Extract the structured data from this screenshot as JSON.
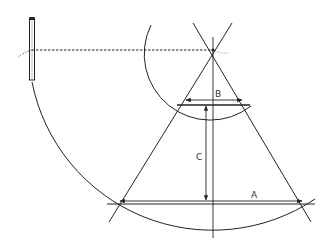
{
  "diagram": {
    "labels": {
      "A": "A",
      "B": "B",
      "C": "C"
    },
    "colors": {
      "stroke": "#222222",
      "background": "#ffffff"
    },
    "elements": [
      {
        "name": "pencil",
        "type": "tool"
      },
      {
        "name": "string-line",
        "type": "dashed-line"
      },
      {
        "name": "large-arc",
        "type": "arc"
      },
      {
        "name": "small-arc",
        "type": "arc"
      },
      {
        "name": "cone-left-edge",
        "type": "line"
      },
      {
        "name": "cone-right-edge",
        "type": "line"
      },
      {
        "name": "center-axis",
        "type": "line"
      },
      {
        "name": "dimension-A",
        "type": "dimension",
        "label": "A"
      },
      {
        "name": "dimension-B",
        "type": "dimension",
        "label": "B"
      },
      {
        "name": "dimension-C",
        "type": "dimension",
        "label": "C"
      }
    ]
  }
}
